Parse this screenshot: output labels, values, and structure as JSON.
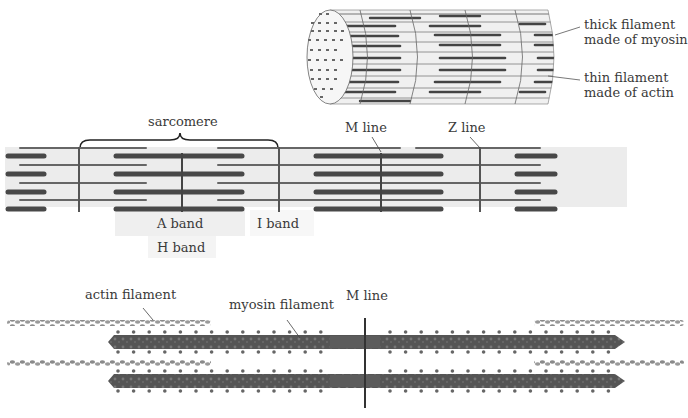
{
  "cylinder": {
    "labels": {
      "thick": [
        "thick filament",
        "made of myosin"
      ],
      "thin": [
        "thin filament",
        "made of actin"
      ]
    }
  },
  "sarcomere_diagram": {
    "labels": {
      "sarcomere": "sarcomere",
      "m_line": "M line",
      "z_line": "Z line",
      "a_band": "A band",
      "i_band": "I band",
      "h_band": "H band"
    }
  },
  "molecular_diagram": {
    "labels": {
      "actin": "actin filament",
      "myosin": "myosin filament",
      "m_line": "M line"
    }
  },
  "caption": "Fig 1.15 — diagram of myofibril and filament arrangement (partially cut off)",
  "colors": {
    "background": "#ffffff",
    "band_fill": "#ececec",
    "thick": "#4a4a4a",
    "thin": "#6a6a6a",
    "line": "#555555"
  }
}
